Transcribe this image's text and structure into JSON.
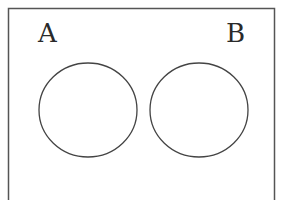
{
  "diagram": {
    "type": "venn",
    "universe": {
      "border_color": "#555555"
    },
    "sets": [
      {
        "label": "A",
        "color": "#444444"
      },
      {
        "label": "B",
        "color": "#444444"
      }
    ]
  }
}
